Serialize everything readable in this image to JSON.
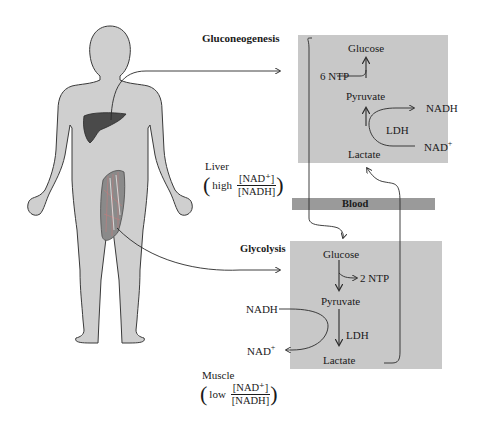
{
  "figure": {
    "colors": {
      "box_fill": "#c8c8c8",
      "blood_bar": "#9a9a9a",
      "body_fill": "#cfcfcf",
      "liver_fill": "#4a4a4a",
      "line": "#2a2a2a"
    },
    "gluconeogenesis": {
      "title": "Gluconeogenesis",
      "glucose": "Glucose",
      "ntp": "6 NTP",
      "pyruvate": "Pyruvate",
      "ldh": "LDH",
      "lactate": "Lactate",
      "nadh": "NADH",
      "nad": "NAD",
      "nad_sup": "+"
    },
    "liver": {
      "label": "Liver",
      "ratio_word": "high",
      "numerator": "[NAD⁺]",
      "denominator": "[NADH]"
    },
    "blood": {
      "label": "Blood"
    },
    "glycolysis": {
      "title": "Glycolysis",
      "glucose": "Glucose",
      "ntp": "2 NTP",
      "pyruvate": "Pyruvate",
      "ldh": "LDH",
      "lactate": "Lactate",
      "nadh": "NADH",
      "nad": "NAD",
      "nad_sup": "+"
    },
    "muscle": {
      "label": "Muscle",
      "ratio_word": "low",
      "numerator": "[NAD⁺]",
      "denominator": "[NADH]"
    }
  }
}
